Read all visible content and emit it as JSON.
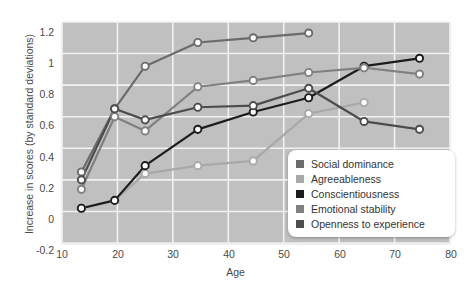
{
  "chart_data": {
    "type": "line",
    "title": "",
    "xlabel": "Age",
    "ylabel": "Increase in scores (by standard deviations)",
    "xlim": [
      10,
      80
    ],
    "ylim": [
      -0.2,
      1.2
    ],
    "xticks": [
      10,
      20,
      30,
      40,
      50,
      60,
      70,
      80
    ],
    "yticks": [
      -0.2,
      0,
      0.2,
      0.4,
      0.6,
      0.8,
      1,
      1.2
    ],
    "xtick_labels": [
      "10",
      "20",
      "30",
      "40",
      "50",
      "60",
      "70",
      "80"
    ],
    "ytick_labels": [
      "-0.2",
      "0",
      "0.2",
      "0.4",
      "0.6",
      "0.8",
      "1",
      "1.2"
    ],
    "grid": true,
    "legend_position": "lower-right-inside",
    "marker": "open-circle",
    "series": [
      {
        "name": "Social dominance",
        "color": "#6b6b6b",
        "x": [
          13.5,
          19.5,
          25.0,
          34.5,
          44.5,
          54.5
        ],
        "y": [
          0.25,
          0.65,
          0.92,
          1.07,
          1.1,
          1.13
        ]
      },
      {
        "name": "Agreeableness",
        "color": "#a8a8a8",
        "x": [
          13.5,
          19.5,
          25.0,
          34.5,
          44.5,
          54.5,
          64.5
        ],
        "y": [
          0.02,
          0.07,
          0.24,
          0.29,
          0.32,
          0.62,
          0.69
        ]
      },
      {
        "name": "Conscientiousness",
        "color": "#1c1c1c",
        "x": [
          13.5,
          19.5,
          25.0,
          34.5,
          44.5,
          54.5,
          64.5,
          74.5
        ],
        "y": [
          0.02,
          0.07,
          0.29,
          0.52,
          0.63,
          0.72,
          0.92,
          0.97
        ]
      },
      {
        "name": "Emotional stability",
        "color": "#808080",
        "x": [
          13.5,
          19.5,
          25.0,
          34.5,
          44.5,
          54.5,
          64.5,
          74.5
        ],
        "y": [
          0.14,
          0.6,
          0.51,
          0.79,
          0.83,
          0.88,
          0.91,
          0.87
        ]
      },
      {
        "name": "Openness to experience",
        "color": "#4d4d4d",
        "x": [
          13.5,
          19.5,
          25.0,
          34.5,
          44.5,
          54.5,
          64.5,
          74.5
        ],
        "y": [
          0.2,
          0.65,
          0.58,
          0.66,
          0.67,
          0.78,
          0.57,
          0.52
        ]
      }
    ]
  },
  "legend": {
    "items": [
      {
        "label": "Social dominance"
      },
      {
        "label": "Agreeableness"
      },
      {
        "label": "Conscientiousness"
      },
      {
        "label": "Emotional stability"
      },
      {
        "label": "Openness to experience"
      }
    ]
  },
  "style": {
    "plot_background": "#c0c0c0",
    "grid_color": "#f2f2f2",
    "marker_fill": "#ffffff",
    "text_color": "#4a4a4a",
    "legend_background": "#ffffff"
  }
}
